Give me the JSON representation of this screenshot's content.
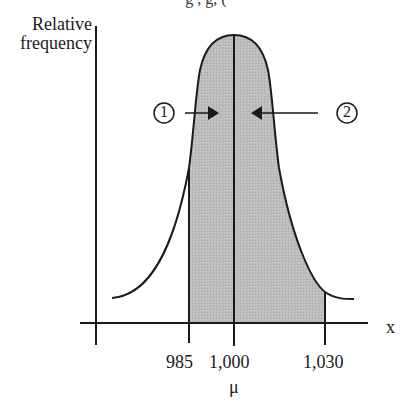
{
  "header": {
    "fragment": "g     ,     g,    ("
  },
  "axes": {
    "ylabel_line1": "Relative",
    "ylabel_line2": "frequency",
    "xlabel": "x"
  },
  "ticks": [
    {
      "label": "985",
      "value": 985
    },
    {
      "label": "1,000",
      "value": 1000
    },
    {
      "label": "1,030",
      "value": 1030
    }
  ],
  "mean_symbol": "μ",
  "annotations": [
    {
      "id": "1",
      "label": "1",
      "arrow_direction": "right",
      "target": "area left of mean (985 to 1,000)"
    },
    {
      "id": "2",
      "label": "2",
      "arrow_direction": "left",
      "target": "area right of mean (1,000 to 1,030)"
    }
  ],
  "shading": {
    "from": 985,
    "to": 1030,
    "color": "#b8b8b8"
  },
  "colors": {
    "line": "#1a1a1a",
    "fill": "#b8b8b8",
    "background": "#ffffff"
  }
}
